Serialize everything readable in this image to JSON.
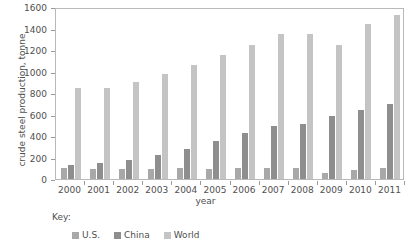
{
  "chart_data": {
    "type": "bar",
    "title": "",
    "xlabel": "year",
    "ylabel": "crude steel production, tonne",
    "categories": [
      "2000",
      "2001",
      "2002",
      "2003",
      "2004",
      "2005",
      "2006",
      "2007",
      "2008",
      "2009",
      "2010",
      "2011"
    ],
    "series": [
      {
        "name": "U.S.",
        "color": "#a8a8a8",
        "values": [
          100,
          90,
          92,
          93,
          100,
          95,
          98,
          98,
          100,
          60,
          88,
          98
        ]
      },
      {
        "name": "China",
        "color": "#8e8e8e",
        "values": [
          130,
          150,
          180,
          225,
          275,
          355,
          425,
          495,
          515,
          585,
          645,
          700
        ]
      },
      {
        "name": "World",
        "color": "#c4c4c4",
        "values": [
          845,
          845,
          905,
          975,
          1065,
          1150,
          1250,
          1350,
          1345,
          1245,
          1440,
          1530
        ]
      }
    ],
    "ylim": [
      0,
      1600
    ],
    "yticks": [
      0,
      200,
      400,
      600,
      800,
      1000,
      1200,
      1400,
      1600
    ],
    "ytick_labels": [
      "0",
      "200",
      "400",
      "600",
      "800",
      "1000",
      "1200",
      "1400",
      "1600"
    ],
    "grid": false,
    "legend_position": "bottom-left",
    "legend_title": "Key:"
  }
}
